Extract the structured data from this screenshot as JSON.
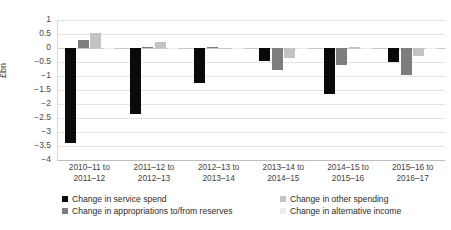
{
  "chart_data": {
    "type": "bar",
    "title": "",
    "xlabel": "",
    "ylabel": "£bn",
    "ylim": [
      -4,
      1
    ],
    "ytick_step": 0.5,
    "grid": true,
    "legend_position": "bottom",
    "categories": [
      "2010–11 to 2011–12",
      "2011–12 to 2012–13",
      "2012–13 to 2013–14",
      "2013–14 to 2014–15",
      "2014–15 to 2015–16",
      "2015–16 to 2016–17"
    ],
    "category_lines": [
      [
        "2010–11 to",
        "2011–12"
      ],
      [
        "2011–12 to",
        "2012–13"
      ],
      [
        "2012–13 to",
        "2013–14"
      ],
      [
        "2013–14 to",
        "2014–15"
      ],
      [
        "2014–15 to",
        "2015–16"
      ],
      [
        "2015–16 to",
        "2016–17"
      ]
    ],
    "yticks": [
      "1",
      "0.5",
      "0",
      "-0.5",
      "-1",
      "-1.5",
      "-2",
      "-2.5",
      "-3",
      "-3.5",
      "-4"
    ],
    "ytick_values": [
      1,
      0.5,
      0,
      -0.5,
      -1,
      -1.5,
      -2,
      -2.5,
      -3,
      -3.5,
      -4
    ],
    "series": [
      {
        "name": "Change in service spend",
        "color": "#0a0a0a",
        "values": [
          -3.4,
          -2.35,
          -1.25,
          -0.45,
          -1.65,
          -0.5
        ]
      },
      {
        "name": "Change in appropriations to/from reserves",
        "color": "#7d7d7d",
        "values": [
          0.3,
          0.05,
          0.05,
          -0.8,
          -0.6,
          -0.95
        ]
      },
      {
        "name": "Change in other spending",
        "color": "#c3c3c3",
        "values": [
          0.55,
          0.2,
          0.0,
          -0.35,
          0.02,
          -0.3
        ]
      },
      {
        "name": "Change in alternative income",
        "color": "#ededed",
        "values": [
          -0.02,
          -0.05,
          -0.05,
          -0.02,
          -0.02,
          -0.05
        ]
      }
    ]
  },
  "legend": {
    "items": [
      {
        "label": "Change in service spend",
        "color": "#0a0a0a"
      },
      {
        "label": "Change in appropriations to/from reserves",
        "color": "#7d7d7d"
      },
      {
        "label": "Change in other spending",
        "color": "#c3c3c3"
      },
      {
        "label": "Change in alternative income",
        "color": "#ededed"
      }
    ]
  },
  "axis": {
    "y_title": "£bn"
  }
}
